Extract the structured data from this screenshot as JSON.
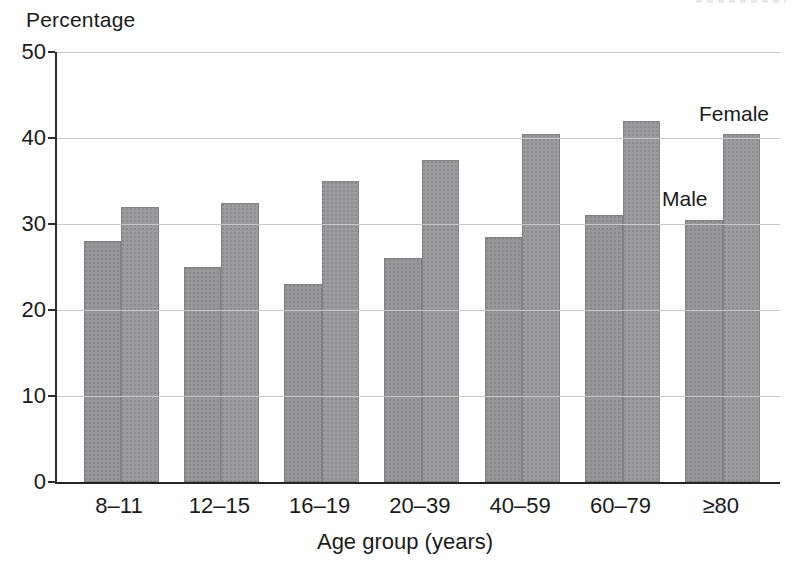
{
  "labels": {
    "y_axis_title": "Percentage",
    "x_axis_title": "Age group (years)"
  },
  "chart_data": {
    "type": "bar",
    "title": "",
    "xlabel": "Age group (years)",
    "ylabel": "Percentage",
    "categories": [
      "8–11",
      "12–15",
      "16–19",
      "20–39",
      "40–59",
      "60–79",
      "≥80"
    ],
    "series": [
      {
        "name": "Male",
        "color": "#98989a",
        "values": [
          28,
          25,
          23,
          26,
          28.5,
          31,
          30.5
        ]
      },
      {
        "name": "Female",
        "color": "#9c9c9e",
        "values": [
          32,
          32.5,
          35,
          37.5,
          40.5,
          42,
          40.5
        ]
      }
    ],
    "ylim": [
      0,
      50
    ],
    "yticks": [
      0,
      10,
      20,
      30,
      40,
      50
    ],
    "grid": true,
    "gridline_color": "#c8c8c8",
    "legend_position": "inline-annotations-right",
    "annotations": [
      {
        "text": "Female"
      },
      {
        "text": "Male"
      }
    ]
  }
}
